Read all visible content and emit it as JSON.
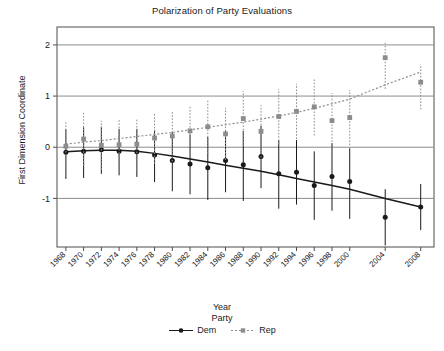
{
  "chart_data": {
    "type": "scatter",
    "title": "Polarization of Party Evaluations",
    "xlabel": "Year",
    "ylabel": "First Dimension Coordinate",
    "xlim": [
      1967,
      2009.5
    ],
    "ylim": [
      -1.95,
      2.35
    ],
    "yticks": [
      -1,
      0,
      1,
      2
    ],
    "ytick_labels": [
      "-1",
      "0",
      "1",
      "2"
    ],
    "grid": true,
    "grid_axis": "y",
    "legend": {
      "title": "Party",
      "position": "bottom",
      "entries": [
        {
          "label": "Dem",
          "color": "#1a1a1a",
          "marker": "circle",
          "line": "solid"
        },
        {
          "label": "Rep",
          "color": "#8c8c8c",
          "marker": "square",
          "line": "dotted"
        }
      ]
    },
    "x": [
      1968,
      1970,
      1972,
      1974,
      1976,
      1978,
      1980,
      1982,
      1984,
      1986,
      1988,
      1990,
      1992,
      1994,
      1996,
      1998,
      2000,
      2004,
      2008
    ],
    "xtick_labels": [
      "1968",
      "1970",
      "1972",
      "1974",
      "1976",
      "1978",
      "1980",
      "1982",
      "1984",
      "1986",
      "1988",
      "1990",
      "1992",
      "1994",
      "1996",
      "1998",
      "2000",
      "2004",
      "2008"
    ],
    "series": [
      {
        "name": "Dem",
        "color": "#1a1a1a",
        "marker": "circle",
        "values": [
          -0.1,
          -0.08,
          -0.05,
          -0.08,
          -0.09,
          -0.15,
          -0.26,
          -0.33,
          -0.4,
          -0.26,
          -0.34,
          -0.18,
          -0.52,
          -0.49,
          -0.75,
          -0.57,
          -0.67,
          -1.37,
          -1.17
        ],
        "err_low": [
          -0.62,
          -0.6,
          -0.52,
          -0.55,
          -0.58,
          -0.68,
          -0.86,
          -0.92,
          -1.03,
          -0.88,
          -1.05,
          -0.8,
          -1.2,
          -1.12,
          -1.42,
          -1.24,
          -1.4,
          -1.92,
          -1.62
        ],
        "err_high": [
          0.35,
          0.39,
          0.4,
          0.36,
          0.36,
          0.34,
          0.3,
          0.25,
          0.2,
          0.33,
          0.32,
          0.42,
          0.14,
          0.14,
          -0.08,
          0.08,
          -0.02,
          -0.82,
          -0.72
        ],
        "trend": [
          -0.09,
          -0.07,
          -0.06,
          -0.06,
          -0.08,
          -0.12,
          -0.17,
          -0.23,
          -0.29,
          -0.35,
          -0.41,
          -0.47,
          -0.54,
          -0.61,
          -0.68,
          -0.75,
          -0.82,
          -1.0,
          -1.17
        ]
      },
      {
        "name": "Rep",
        "color": "#8c8c8c",
        "marker": "square",
        "values": [
          0.02,
          0.16,
          0.04,
          0.05,
          0.06,
          0.18,
          0.22,
          0.32,
          0.4,
          0.26,
          0.56,
          0.31,
          0.6,
          0.7,
          0.79,
          0.52,
          0.58,
          1.75,
          1.27
        ],
        "err_low": [
          -0.48,
          -0.36,
          -0.44,
          -0.44,
          -0.43,
          -0.32,
          -0.28,
          -0.18,
          -0.12,
          -0.25,
          0.02,
          -0.2,
          0.06,
          0.16,
          0.23,
          -0.02,
          0.04,
          1.14,
          0.74
        ],
        "err_high": [
          0.52,
          0.68,
          0.52,
          0.54,
          0.55,
          0.68,
          0.72,
          0.82,
          0.92,
          0.77,
          1.1,
          0.82,
          1.14,
          1.24,
          1.35,
          1.06,
          1.12,
          2.04,
          1.62
        ],
        "trend": [
          0.06,
          0.1,
          0.13,
          0.17,
          0.21,
          0.25,
          0.29,
          0.34,
          0.39,
          0.44,
          0.49,
          0.55,
          0.61,
          0.68,
          0.76,
          0.85,
          0.94,
          1.22,
          1.47
        ]
      }
    ]
  }
}
